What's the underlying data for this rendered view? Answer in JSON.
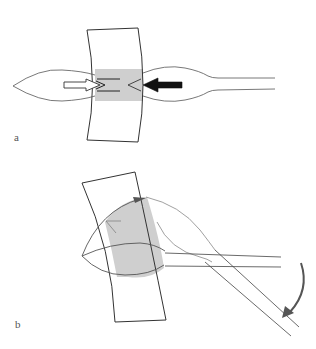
{
  "figure": {
    "panels": [
      {
        "id": "a",
        "label": "a",
        "description": "Straight configuration: lens-shaped element inserted through curved band; hollow arrow pushes from left, solid arrow pushes from right; shaded overlap region"
      },
      {
        "id": "b",
        "label": "b",
        "description": "Rotated configuration: band tilted, shaded lens-shaped region, handle/rod swung downward as indicated by curved arrow"
      }
    ],
    "colors": {
      "stroke": "#333333",
      "light_stroke": "#888888",
      "shade": "#cfcfcf",
      "arrow_solid": "#111111",
      "arrow_rotation": "#555555",
      "background": "#ffffff"
    },
    "icons": {
      "hollow_arrow": "arrow-right-outline",
      "solid_arrow": "arrow-left-solid",
      "rotation_arrow": "curved-arrow-clockwise"
    }
  }
}
